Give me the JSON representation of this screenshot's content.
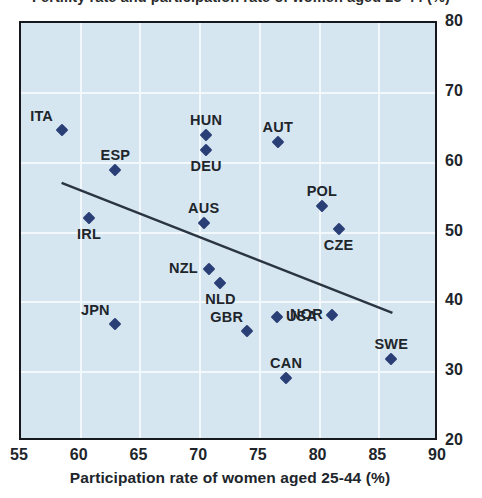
{
  "chart_data": {
    "type": "scatter",
    "title": "Fertility rate and participation rate of women aged 25-44 (%)",
    "xlabel": "Participation rate of women aged 25-44 (%)",
    "ylabel": "",
    "xlim": [
      55,
      90
    ],
    "ylim": [
      20,
      80
    ],
    "xticks": [
      55,
      60,
      65,
      70,
      75,
      80,
      85,
      90
    ],
    "yticks": [
      20,
      30,
      40,
      50,
      60,
      70,
      80
    ],
    "grid": true,
    "legend": "none",
    "y_axis_position": "right",
    "marker": "diamond",
    "marker_color": "#2b3f77",
    "plot_background": "#d5e6f0",
    "trend_line": {
      "label": "linear fit",
      "color": "#2a3442",
      "x0": 58.4,
      "y0": 57.1,
      "x1": 86.1,
      "y1": 38.5
    },
    "points": [
      {
        "label": "ITA",
        "x": 58.4,
        "y": 64.7,
        "label_pos": "above-left"
      },
      {
        "label": "ESP",
        "x": 62.9,
        "y": 59.0,
        "label_pos": "above"
      },
      {
        "label": "IRL",
        "x": 60.7,
        "y": 52.1,
        "label_pos": "below"
      },
      {
        "label": "JPN",
        "x": 62.9,
        "y": 36.9,
        "label_pos": "above-left"
      },
      {
        "label": "HUN",
        "x": 70.5,
        "y": 64.0,
        "label_pos": "above"
      },
      {
        "label": "DEU",
        "x": 70.5,
        "y": 61.8,
        "label_pos": "below"
      },
      {
        "label": "AUS",
        "x": 70.3,
        "y": 51.4,
        "label_pos": "above"
      },
      {
        "label": "NZL",
        "x": 70.7,
        "y": 44.8,
        "label_pos": "left"
      },
      {
        "label": "NLD",
        "x": 71.7,
        "y": 42.8,
        "label_pos": "below"
      },
      {
        "label": "AUT",
        "x": 76.5,
        "y": 62.9,
        "label_pos": "above"
      },
      {
        "label": "GBR",
        "x": 73.9,
        "y": 35.9,
        "label_pos": "above-left"
      },
      {
        "label": "USA",
        "x": 76.4,
        "y": 37.9,
        "label_pos": "right"
      },
      {
        "label": "CAN",
        "x": 77.2,
        "y": 29.2,
        "label_pos": "above"
      },
      {
        "label": "POL",
        "x": 80.2,
        "y": 53.8,
        "label_pos": "above"
      },
      {
        "label": "CZE",
        "x": 81.6,
        "y": 50.5,
        "label_pos": "below"
      },
      {
        "label": "NOR",
        "x": 81.0,
        "y": 38.2,
        "label_pos": "left"
      },
      {
        "label": "SWE",
        "x": 86.0,
        "y": 31.9,
        "label_pos": "above"
      }
    ]
  }
}
